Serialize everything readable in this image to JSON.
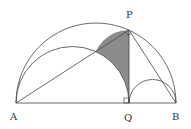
{
  "diagram": {
    "type": "geometry",
    "labels": {
      "A": "A",
      "B": "B",
      "P": "P",
      "Q": "Q"
    },
    "colors": {
      "stroke": "#444444",
      "shade": "#8c8c8c",
      "background": "#ffffff"
    },
    "elements": [
      "semicircle on diameter AB",
      "semicircle on diameter AQ",
      "semicircle on diameter QB",
      "segment AB",
      "segment PQ perpendicular to AB",
      "segment AP",
      "segment PB",
      "shaded lune: half circle on PQ minus semicircle on AQ",
      "right angle mark at Q",
      "right angle mark at P"
    ]
  }
}
